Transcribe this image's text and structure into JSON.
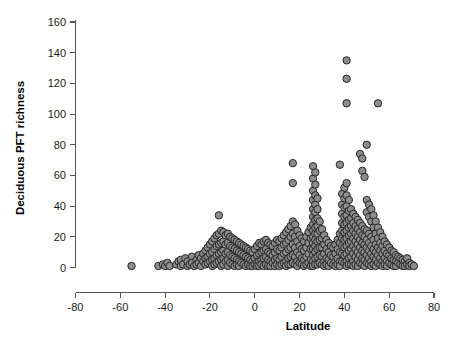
{
  "chart_data": {
    "type": "scatter",
    "title": "",
    "xlabel": "Latitude",
    "ylabel": "Deciduous PFT richness",
    "xlim": [
      -80,
      80
    ],
    "ylim": [
      0,
      160
    ],
    "xticks": [
      -80,
      -60,
      -40,
      -20,
      0,
      20,
      40,
      60,
      80
    ],
    "yticks": [
      0,
      20,
      40,
      60,
      80,
      100,
      120,
      140,
      160
    ],
    "xtick_labels": [
      "-80",
      "-60",
      "-40",
      "-20",
      "0",
      "20",
      "40",
      "60",
      "80"
    ],
    "ytick_labels": [
      "0",
      "20",
      "40",
      "60",
      "80",
      "100",
      "120",
      "140",
      "160"
    ],
    "grid": false,
    "legend": "none",
    "marker": {
      "shape": "circle",
      "fill_color": "#8c8c8c",
      "edge_color": "#262626",
      "size_px": 7.4
    },
    "point_count": 430,
    "points": [
      [
        -55,
        1
      ],
      [
        -43,
        1
      ],
      [
        -41,
        2
      ],
      [
        -40,
        1
      ],
      [
        -39,
        3
      ],
      [
        -38,
        1
      ],
      [
        -35,
        2
      ],
      [
        -34,
        4
      ],
      [
        -33,
        1
      ],
      [
        -33,
        5
      ],
      [
        -32,
        2
      ],
      [
        -31,
        6
      ],
      [
        -30,
        1
      ],
      [
        -30,
        4
      ],
      [
        -29,
        2
      ],
      [
        -28,
        7
      ],
      [
        -28,
        3
      ],
      [
        -27,
        1
      ],
      [
        -26,
        5
      ],
      [
        -26,
        2
      ],
      [
        -25,
        8
      ],
      [
        -25,
        3
      ],
      [
        -24,
        6
      ],
      [
        -24,
        1
      ],
      [
        -23,
        9
      ],
      [
        -23,
        4
      ],
      [
        -22,
        11
      ],
      [
        -22,
        6
      ],
      [
        -22,
        2
      ],
      [
        -21,
        13
      ],
      [
        -21,
        7
      ],
      [
        -21,
        3
      ],
      [
        -20,
        15
      ],
      [
        -20,
        9
      ],
      [
        -20,
        4
      ],
      [
        -19,
        17
      ],
      [
        -19,
        10
      ],
      [
        -19,
        5
      ],
      [
        -19,
        1
      ],
      [
        -18,
        19
      ],
      [
        -18,
        12
      ],
      [
        -18,
        6
      ],
      [
        -18,
        2
      ],
      [
        -17,
        21
      ],
      [
        -17,
        14
      ],
      [
        -17,
        8
      ],
      [
        -17,
        3
      ],
      [
        -16,
        34
      ],
      [
        -16,
        22
      ],
      [
        -16,
        15
      ],
      [
        -16,
        9
      ],
      [
        -16,
        4
      ],
      [
        -15,
        24
      ],
      [
        -15,
        16
      ],
      [
        -15,
        10
      ],
      [
        -15,
        5
      ],
      [
        -15,
        1
      ],
      [
        -14,
        23
      ],
      [
        -14,
        17
      ],
      [
        -14,
        11
      ],
      [
        -14,
        6
      ],
      [
        -14,
        2
      ],
      [
        -13,
        21
      ],
      [
        -13,
        15
      ],
      [
        -13,
        9
      ],
      [
        -13,
        4
      ],
      [
        -12,
        22
      ],
      [
        -12,
        16
      ],
      [
        -12,
        10
      ],
      [
        -12,
        5
      ],
      [
        -12,
        1
      ],
      [
        -11,
        20
      ],
      [
        -11,
        14
      ],
      [
        -11,
        8
      ],
      [
        -11,
        3
      ],
      [
        -10,
        19
      ],
      [
        -10,
        13
      ],
      [
        -10,
        7
      ],
      [
        -10,
        2
      ],
      [
        -9,
        18
      ],
      [
        -9,
        12
      ],
      [
        -9,
        6
      ],
      [
        -9,
        1
      ],
      [
        -8,
        17
      ],
      [
        -8,
        11
      ],
      [
        -8,
        5
      ],
      [
        -8,
        2
      ],
      [
        -7,
        16
      ],
      [
        -7,
        10
      ],
      [
        -7,
        4
      ],
      [
        -7,
        1
      ],
      [
        -6,
        15
      ],
      [
        -6,
        9
      ],
      [
        -6,
        3
      ],
      [
        -5,
        14
      ],
      [
        -5,
        8
      ],
      [
        -5,
        2
      ],
      [
        -4,
        13
      ],
      [
        -4,
        7
      ],
      [
        -4,
        1
      ],
      [
        -3,
        12
      ],
      [
        -3,
        6
      ],
      [
        -3,
        2
      ],
      [
        -2,
        11
      ],
      [
        -2,
        5
      ],
      [
        -2,
        1
      ],
      [
        -1,
        10
      ],
      [
        -1,
        4
      ],
      [
        -1,
        1
      ],
      [
        0,
        12
      ],
      [
        0,
        6
      ],
      [
        0,
        2
      ],
      [
        1,
        14
      ],
      [
        1,
        8
      ],
      [
        1,
        3
      ],
      [
        1,
        1
      ],
      [
        2,
        16
      ],
      [
        2,
        9
      ],
      [
        2,
        4
      ],
      [
        2,
        1
      ],
      [
        3,
        15
      ],
      [
        3,
        10
      ],
      [
        3,
        5
      ],
      [
        3,
        2
      ],
      [
        4,
        17
      ],
      [
        4,
        11
      ],
      [
        4,
        6
      ],
      [
        4,
        1
      ],
      [
        5,
        18
      ],
      [
        5,
        12
      ],
      [
        5,
        7
      ],
      [
        5,
        2
      ],
      [
        6,
        16
      ],
      [
        6,
        10
      ],
      [
        6,
        5
      ],
      [
        6,
        1
      ],
      [
        7,
        15
      ],
      [
        7,
        9
      ],
      [
        7,
        4
      ],
      [
        7,
        1
      ],
      [
        8,
        14
      ],
      [
        8,
        8
      ],
      [
        8,
        3
      ],
      [
        9,
        16
      ],
      [
        9,
        10
      ],
      [
        9,
        5
      ],
      [
        9,
        1
      ],
      [
        10,
        18
      ],
      [
        10,
        12
      ],
      [
        10,
        6
      ],
      [
        10,
        2
      ],
      [
        11,
        17
      ],
      [
        11,
        11
      ],
      [
        11,
        5
      ],
      [
        11,
        1
      ],
      [
        12,
        19
      ],
      [
        12,
        13
      ],
      [
        12,
        7
      ],
      [
        12,
        2
      ],
      [
        13,
        21
      ],
      [
        13,
        15
      ],
      [
        13,
        9
      ],
      [
        13,
        3
      ],
      [
        14,
        23
      ],
      [
        14,
        16
      ],
      [
        14,
        10
      ],
      [
        14,
        4
      ],
      [
        14,
        1
      ],
      [
        15,
        25
      ],
      [
        15,
        18
      ],
      [
        15,
        12
      ],
      [
        15,
        6
      ],
      [
        15,
        2
      ],
      [
        16,
        27
      ],
      [
        16,
        20
      ],
      [
        16,
        13
      ],
      [
        16,
        7
      ],
      [
        16,
        2
      ],
      [
        17,
        68
      ],
      [
        17,
        55
      ],
      [
        17,
        30
      ],
      [
        17,
        22
      ],
      [
        17,
        15
      ],
      [
        17,
        8
      ],
      [
        17,
        3
      ],
      [
        18,
        28
      ],
      [
        18,
        20
      ],
      [
        18,
        13
      ],
      [
        18,
        7
      ],
      [
        18,
        2
      ],
      [
        19,
        24
      ],
      [
        19,
        17
      ],
      [
        19,
        10
      ],
      [
        19,
        4
      ],
      [
        19,
        1
      ],
      [
        20,
        21
      ],
      [
        20,
        14
      ],
      [
        20,
        8
      ],
      [
        20,
        3
      ],
      [
        21,
        19
      ],
      [
        21,
        12
      ],
      [
        21,
        6
      ],
      [
        21,
        2
      ],
      [
        22,
        17
      ],
      [
        22,
        11
      ],
      [
        22,
        5
      ],
      [
        22,
        1
      ],
      [
        23,
        20
      ],
      [
        23,
        13
      ],
      [
        23,
        7
      ],
      [
        23,
        2
      ],
      [
        24,
        23
      ],
      [
        24,
        16
      ],
      [
        24,
        9
      ],
      [
        24,
        3
      ],
      [
        25,
        26
      ],
      [
        25,
        19
      ],
      [
        25,
        12
      ],
      [
        25,
        5
      ],
      [
        25,
        1
      ],
      [
        26,
        66
      ],
      [
        26,
        58
      ],
      [
        26,
        50
      ],
      [
        26,
        44
      ],
      [
        26,
        38
      ],
      [
        26,
        33
      ],
      [
        26,
        28
      ],
      [
        26,
        24
      ],
      [
        26,
        20
      ],
      [
        26,
        16
      ],
      [
        26,
        12
      ],
      [
        26,
        8
      ],
      [
        26,
        4
      ],
      [
        26,
        1
      ],
      [
        27,
        62
      ],
      [
        27,
        54
      ],
      [
        27,
        47
      ],
      [
        27,
        41
      ],
      [
        27,
        36
      ],
      [
        27,
        31
      ],
      [
        27,
        26
      ],
      [
        27,
        22
      ],
      [
        27,
        18
      ],
      [
        27,
        14
      ],
      [
        27,
        10
      ],
      [
        27,
        6
      ],
      [
        27,
        2
      ],
      [
        28,
        45
      ],
      [
        28,
        38
      ],
      [
        28,
        32
      ],
      [
        28,
        27
      ],
      [
        28,
        22
      ],
      [
        28,
        17
      ],
      [
        28,
        12
      ],
      [
        28,
        7
      ],
      [
        28,
        2
      ],
      [
        29,
        30
      ],
      [
        29,
        24
      ],
      [
        29,
        18
      ],
      [
        29,
        13
      ],
      [
        29,
        8
      ],
      [
        29,
        3
      ],
      [
        30,
        25
      ],
      [
        30,
        19
      ],
      [
        30,
        13
      ],
      [
        30,
        7
      ],
      [
        30,
        2
      ],
      [
        31,
        21
      ],
      [
        31,
        15
      ],
      [
        31,
        9
      ],
      [
        31,
        4
      ],
      [
        31,
        1
      ],
      [
        32,
        18
      ],
      [
        32,
        12
      ],
      [
        32,
        6
      ],
      [
        32,
        2
      ],
      [
        33,
        16
      ],
      [
        33,
        10
      ],
      [
        33,
        5
      ],
      [
        33,
        1
      ],
      [
        34,
        14
      ],
      [
        34,
        8
      ],
      [
        34,
        3
      ],
      [
        35,
        13
      ],
      [
        35,
        7
      ],
      [
        35,
        2
      ],
      [
        36,
        15
      ],
      [
        36,
        9
      ],
      [
        36,
        4
      ],
      [
        36,
        1
      ],
      [
        37,
        18
      ],
      [
        37,
        12
      ],
      [
        37,
        6
      ],
      [
        37,
        2
      ],
      [
        38,
        67
      ],
      [
        38,
        22
      ],
      [
        38,
        16
      ],
      [
        38,
        10
      ],
      [
        38,
        4
      ],
      [
        38,
        1
      ],
      [
        39,
        48
      ],
      [
        39,
        41
      ],
      [
        39,
        35
      ],
      [
        39,
        29
      ],
      [
        39,
        24
      ],
      [
        39,
        19
      ],
      [
        39,
        14
      ],
      [
        39,
        9
      ],
      [
        39,
        4
      ],
      [
        40,
        52
      ],
      [
        40,
        45
      ],
      [
        40,
        39
      ],
      [
        40,
        33
      ],
      [
        40,
        28
      ],
      [
        40,
        23
      ],
      [
        40,
        18
      ],
      [
        40,
        13
      ],
      [
        40,
        8
      ],
      [
        40,
        3
      ],
      [
        41,
        135
      ],
      [
        41,
        123
      ],
      [
        41,
        107
      ],
      [
        41,
        55
      ],
      [
        41,
        47
      ],
      [
        41,
        40
      ],
      [
        41,
        34
      ],
      [
        41,
        29
      ],
      [
        41,
        24
      ],
      [
        41,
        19
      ],
      [
        41,
        14
      ],
      [
        41,
        9
      ],
      [
        41,
        4
      ],
      [
        41,
        1
      ],
      [
        42,
        44
      ],
      [
        42,
        37
      ],
      [
        42,
        31
      ],
      [
        42,
        26
      ],
      [
        42,
        21
      ],
      [
        42,
        16
      ],
      [
        42,
        11
      ],
      [
        42,
        6
      ],
      [
        42,
        2
      ],
      [
        43,
        38
      ],
      [
        43,
        32
      ],
      [
        43,
        27
      ],
      [
        43,
        22
      ],
      [
        43,
        17
      ],
      [
        43,
        12
      ],
      [
        43,
        7
      ],
      [
        43,
        2
      ],
      [
        44,
        35
      ],
      [
        44,
        29
      ],
      [
        44,
        24
      ],
      [
        44,
        19
      ],
      [
        44,
        14
      ],
      [
        44,
        9
      ],
      [
        44,
        4
      ],
      [
        44,
        1
      ],
      [
        45,
        33
      ],
      [
        45,
        27
      ],
      [
        45,
        22
      ],
      [
        45,
        17
      ],
      [
        45,
        12
      ],
      [
        45,
        7
      ],
      [
        45,
        2
      ],
      [
        46,
        31
      ],
      [
        46,
        25
      ],
      [
        46,
        20
      ],
      [
        46,
        15
      ],
      [
        46,
        10
      ],
      [
        46,
        5
      ],
      [
        46,
        1
      ],
      [
        47,
        74
      ],
      [
        47,
        29
      ],
      [
        47,
        23
      ],
      [
        47,
        18
      ],
      [
        47,
        13
      ],
      [
        47,
        8
      ],
      [
        47,
        3
      ],
      [
        48,
        71
      ],
      [
        48,
        63
      ],
      [
        48,
        27
      ],
      [
        48,
        21
      ],
      [
        48,
        16
      ],
      [
        48,
        11
      ],
      [
        48,
        6
      ],
      [
        48,
        2
      ],
      [
        49,
        59
      ],
      [
        49,
        25
      ],
      [
        49,
        20
      ],
      [
        49,
        15
      ],
      [
        49,
        10
      ],
      [
        49,
        5
      ],
      [
        49,
        1
      ],
      [
        50,
        80
      ],
      [
        50,
        44
      ],
      [
        50,
        36
      ],
      [
        50,
        24
      ],
      [
        50,
        18
      ],
      [
        50,
        13
      ],
      [
        50,
        8
      ],
      [
        50,
        3
      ],
      [
        51,
        41
      ],
      [
        51,
        33
      ],
      [
        51,
        22
      ],
      [
        51,
        16
      ],
      [
        51,
        11
      ],
      [
        51,
        6
      ],
      [
        51,
        2
      ],
      [
        52,
        38
      ],
      [
        52,
        30
      ],
      [
        52,
        20
      ],
      [
        52,
        14
      ],
      [
        52,
        9
      ],
      [
        52,
        4
      ],
      [
        52,
        1
      ],
      [
        53,
        34
      ],
      [
        53,
        26
      ],
      [
        53,
        18
      ],
      [
        53,
        12
      ],
      [
        53,
        7
      ],
      [
        53,
        2
      ],
      [
        54,
        30
      ],
      [
        54,
        22
      ],
      [
        54,
        15
      ],
      [
        54,
        10
      ],
      [
        54,
        5
      ],
      [
        54,
        1
      ],
      [
        55,
        107
      ],
      [
        55,
        26
      ],
      [
        55,
        19
      ],
      [
        55,
        13
      ],
      [
        55,
        8
      ],
      [
        55,
        3
      ],
      [
        56,
        23
      ],
      [
        56,
        16
      ],
      [
        56,
        11
      ],
      [
        56,
        6
      ],
      [
        56,
        2
      ],
      [
        57,
        20
      ],
      [
        57,
        14
      ],
      [
        57,
        9
      ],
      [
        57,
        4
      ],
      [
        57,
        1
      ],
      [
        58,
        17
      ],
      [
        58,
        11
      ],
      [
        58,
        6
      ],
      [
        58,
        2
      ],
      [
        59,
        15
      ],
      [
        59,
        9
      ],
      [
        59,
        4
      ],
      [
        59,
        1
      ],
      [
        60,
        13
      ],
      [
        60,
        8
      ],
      [
        60,
        3
      ],
      [
        61,
        11
      ],
      [
        61,
        6
      ],
      [
        61,
        2
      ],
      [
        62,
        10
      ],
      [
        62,
        5
      ],
      [
        62,
        1
      ],
      [
        63,
        8
      ],
      [
        63,
        4
      ],
      [
        63,
        1
      ],
      [
        64,
        7
      ],
      [
        64,
        3
      ],
      [
        65,
        6
      ],
      [
        65,
        2
      ],
      [
        66,
        5
      ],
      [
        66,
        1
      ],
      [
        67,
        4
      ],
      [
        67,
        1
      ],
      [
        68,
        6
      ],
      [
        68,
        2
      ],
      [
        69,
        3
      ],
      [
        69,
        1
      ],
      [
        70,
        2
      ],
      [
        71,
        1
      ]
    ]
  },
  "axes": {
    "x_axis_name": "latitude-axis",
    "y_axis_name": "richness-axis"
  }
}
